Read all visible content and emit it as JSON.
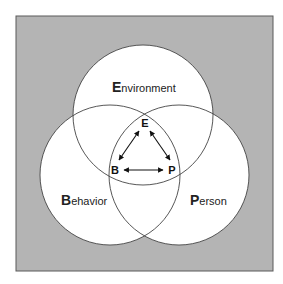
{
  "diagram": {
    "type": "venn-triad",
    "colors": {
      "background": "#b4b4b4",
      "frame_border": "#5a5a5a",
      "circle_fill": "#ffffff",
      "circle_stroke": "#444444",
      "text": "#222222"
    },
    "circles": [
      {
        "id": "environment",
        "initial": "E",
        "rest": "nvironment"
      },
      {
        "id": "behavior",
        "initial": "B",
        "rest": "ehavior"
      },
      {
        "id": "person",
        "initial": "P",
        "rest": "erson"
      }
    ],
    "triangle": {
      "nodes": [
        "E",
        "B",
        "P"
      ],
      "edges": [
        {
          "from": "E",
          "to": "B",
          "bidirectional": true
        },
        {
          "from": "E",
          "to": "P",
          "bidirectional": true
        },
        {
          "from": "B",
          "to": "P",
          "bidirectional": true
        }
      ]
    }
  }
}
